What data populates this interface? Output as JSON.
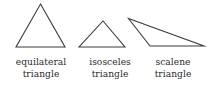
{
  "figure": {
    "background_color": "#ffffff",
    "stroke_color": "#3a3a3a",
    "text_color": "#2b2b2b"
  },
  "shapes": [
    {
      "id": "equilateral",
      "name": "equilateral-triangle",
      "points": "40.5,4 65,47 16,47"
    },
    {
      "id": "isosceles",
      "name": "isosceles-triangle",
      "points": "103,21 125,47 79,47"
    },
    {
      "id": "scalene",
      "name": "scalene-triangle",
      "points": "128.5,18.5 204,46 150,46"
    }
  ],
  "labels": [
    {
      "id": "equilateral",
      "line1": "equilateral",
      "line2": "triangle"
    },
    {
      "id": "isosceles",
      "line1": "isosceles",
      "line2": "triangle"
    },
    {
      "id": "scalene",
      "line1": "scalene",
      "line2": "triangle"
    }
  ]
}
